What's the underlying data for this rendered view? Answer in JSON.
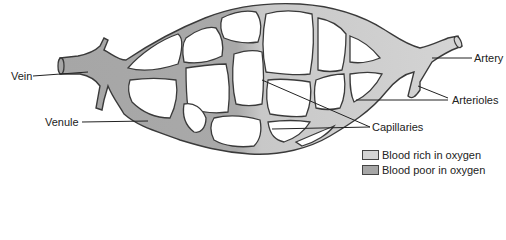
{
  "diagram": {
    "title": "",
    "labels": {
      "vein": "Vein",
      "venule": "Venule",
      "artery": "Artery",
      "arterioles": "Arterioles",
      "capillaries": "Capillaries"
    },
    "legend": [
      {
        "label": "Blood rich in oxygen",
        "color": "#d4d4d4"
      },
      {
        "label": "Blood poor in oxygen",
        "color": "#a6a6a6"
      }
    ],
    "colors": {
      "oxygen_rich": "#d4d4d4",
      "oxygen_poor": "#a6a6a6",
      "outline": "#3a3a3a",
      "leader_line": "#222222"
    }
  }
}
